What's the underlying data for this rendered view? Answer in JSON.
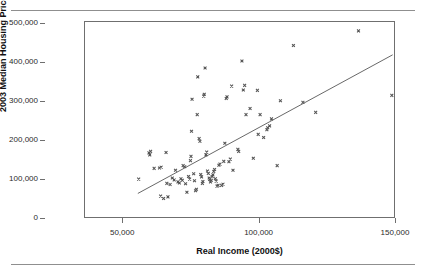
{
  "figure": {
    "clipped_header_text": "",
    "top_rule": true,
    "bottom_rule": true
  },
  "chart_data": {
    "type": "scatter",
    "title": "",
    "xlabel": "Real Income (2000$)",
    "ylabel": "2003 Median Housing Price (2000$)",
    "xlim": [
      36000,
      150000
    ],
    "ylim": [
      0,
      505000
    ],
    "xticks": [
      50000,
      100000,
      150000
    ],
    "xtick_labels": [
      "50,000",
      "100,000",
      "150,000"
    ],
    "yticks": [
      0,
      100000,
      200000,
      300000,
      400000,
      500000
    ],
    "ytick_labels": [
      "0",
      "100,000",
      "200,000",
      "300,000",
      "400,000",
      "500,000"
    ],
    "grid": false,
    "legend": false,
    "marker": "x",
    "marker_color": "#555555",
    "line_color": "#555555",
    "frame_color": "#6f6f6f",
    "trendline": {
      "label": "linear fit",
      "x": [
        55500,
        149500
      ],
      "y": [
        61000,
        420000
      ]
    },
    "points": [
      [
        55800,
        98000
      ],
      [
        59600,
        166000
      ],
      [
        59900,
        161000
      ],
      [
        60200,
        170000
      ],
      [
        61500,
        126000
      ],
      [
        63500,
        127000
      ],
      [
        64100,
        129000
      ],
      [
        65900,
        167000
      ],
      [
        63900,
        54000
      ],
      [
        65000,
        48000
      ],
      [
        66600,
        52000
      ],
      [
        66200,
        87000
      ],
      [
        67400,
        84000
      ],
      [
        68200,
        101000
      ],
      [
        68900,
        96000
      ],
      [
        69400,
        121000
      ],
      [
        70300,
        91000
      ],
      [
        70800,
        88000
      ],
      [
        71400,
        99000
      ],
      [
        71900,
        95000
      ],
      [
        72200,
        133000
      ],
      [
        72800,
        130000
      ],
      [
        73100,
        86000
      ],
      [
        73600,
        64000
      ],
      [
        74200,
        105000
      ],
      [
        74600,
        98000
      ],
      [
        74900,
        146000
      ],
      [
        75100,
        157000
      ],
      [
        75300,
        222000
      ],
      [
        75500,
        305000
      ],
      [
        76100,
        112000
      ],
      [
        76400,
        94000
      ],
      [
        76800,
        68000
      ],
      [
        77100,
        72000
      ],
      [
        77400,
        265000
      ],
      [
        77600,
        363000
      ],
      [
        78100,
        203000
      ],
      [
        78400,
        196000
      ],
      [
        78700,
        110000
      ],
      [
        79000,
        104000
      ],
      [
        79300,
        87000
      ],
      [
        79500,
        92000
      ],
      [
        79800,
        313000
      ],
      [
        80000,
        318000
      ],
      [
        80300,
        386000
      ],
      [
        80600,
        161000
      ],
      [
        80900,
        168000
      ],
      [
        81200,
        119000
      ],
      [
        81500,
        113000
      ],
      [
        81800,
        101000
      ],
      [
        82000,
        97000
      ],
      [
        82300,
        91000
      ],
      [
        82600,
        95000
      ],
      [
        82900,
        105000
      ],
      [
        83200,
        109000
      ],
      [
        83500,
        118000
      ],
      [
        83800,
        123000
      ],
      [
        84100,
        99000
      ],
      [
        84400,
        93000
      ],
      [
        84700,
        80000
      ],
      [
        85100,
        82000
      ],
      [
        85400,
        134000
      ],
      [
        85800,
        137000
      ],
      [
        86400,
        82000
      ],
      [
        86900,
        85000
      ],
      [
        87200,
        144000
      ],
      [
        87600,
        191000
      ],
      [
        88100,
        307000
      ],
      [
        88400,
        311000
      ],
      [
        89100,
        143000
      ],
      [
        89600,
        150000
      ],
      [
        90100,
        339000
      ],
      [
        90600,
        121000
      ],
      [
        92400,
        175000
      ],
      [
        92700,
        170000
      ],
      [
        93900,
        404000
      ],
      [
        94400,
        329000
      ],
      [
        94900,
        341000
      ],
      [
        95400,
        265000
      ],
      [
        96900,
        281000
      ],
      [
        98100,
        152000
      ],
      [
        99600,
        328000
      ],
      [
        99900,
        214000
      ],
      [
        100600,
        265000
      ],
      [
        101900,
        206000
      ],
      [
        103100,
        226000
      ],
      [
        103400,
        231000
      ],
      [
        104100,
        236000
      ],
      [
        104800,
        254000
      ],
      [
        106900,
        133000
      ],
      [
        108100,
        301000
      ],
      [
        112900,
        444000
      ],
      [
        116400,
        297000
      ],
      [
        121100,
        271000
      ],
      [
        136900,
        482000
      ],
      [
        149200,
        315000
      ]
    ]
  }
}
